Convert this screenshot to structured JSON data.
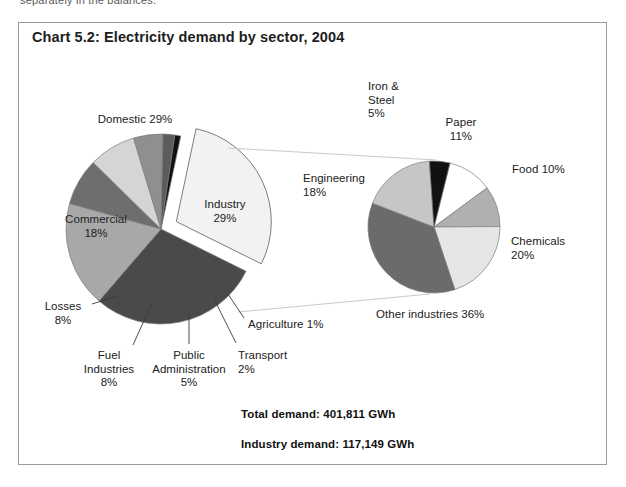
{
  "page": {
    "cutoff_text": "separately in the balances."
  },
  "chart_title": "Chart 5.2: Electricity demand by sector, 2004",
  "totals": {
    "total_demand": "Total demand: 401,811 GWh",
    "industry_demand": "Industry demand: 117,149 GWh"
  },
  "left_labels": {
    "domestic": "Domestic 29%",
    "commercial": "Commercial\n18%",
    "losses": "Losses\n8%",
    "fuel_industries": "Fuel\nIndustries\n8%",
    "public_administration": "Public\nAdministration\n5%",
    "transport": "Transport\n2%",
    "agriculture": "Agriculture 1%",
    "industry": "Industry\n29%"
  },
  "right_labels": {
    "iron_steel": "Iron &\nSteel\n5%",
    "paper": "Paper\n11%",
    "food": "Food 10%",
    "chemicals": "Chemicals\n20%",
    "other_industries": "Other industries 36%",
    "engineering": "Engineering\n18%"
  },
  "chart_data": {
    "type": "pie",
    "title": "Chart 5.2: Electricity demand by sector, 2004",
    "legend": "none",
    "annotations": [
      "Total demand: 401,811 GWh",
      "Industry demand: 117,149 GWh"
    ],
    "charts": [
      {
        "name": "Electricity demand by sector",
        "type": "pie",
        "units": "percent",
        "total_label": "Total demand: 401,811 GWh",
        "total_value": 401811,
        "total_units": "GWh",
        "categories": [
          "Industry",
          "Domestic",
          "Commercial",
          "Losses",
          "Fuel Industries",
          "Public Administration",
          "Transport",
          "Agriculture"
        ],
        "values": [
          29,
          29,
          18,
          8,
          8,
          5,
          2,
          1
        ],
        "colors": [
          "#f2f2f2",
          "#4a4a4a",
          "#a8a8a8",
          "#6e6e6e",
          "#d5d5d5",
          "#8f8f8f",
          "#5c5c5c",
          "#111111"
        ],
        "exploded": [
          "Industry"
        ]
      },
      {
        "name": "Industry demand by sub-sector",
        "type": "pie",
        "units": "percent",
        "total_label": "Industry demand: 117,149 GWh",
        "total_value": 117149,
        "total_units": "GWh",
        "categories": [
          "Paper",
          "Food",
          "Chemicals",
          "Other industries",
          "Engineering",
          "Iron & Steel"
        ],
        "values": [
          11,
          10,
          20,
          36,
          18,
          5
        ],
        "colors": [
          "#ffffff",
          "#b0b0b0",
          "#e6e6e6",
          "#6b6b6b",
          "#c6c6c6",
          "#111111"
        ]
      }
    ]
  },
  "geometry": {
    "left_pie": {
      "cx": 161,
      "cy": 229,
      "r": 95,
      "start_angle_deg": -78
    },
    "right_pie": {
      "cx": 434,
      "cy": 227,
      "r": 66,
      "start_angle_deg": -76
    }
  }
}
